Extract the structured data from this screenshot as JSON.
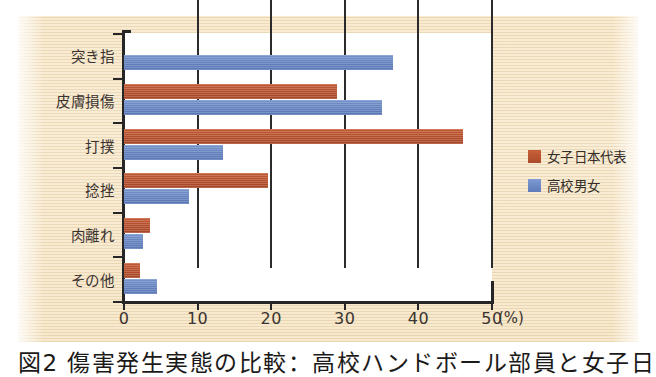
{
  "figure": {
    "caption": "図2 傷害発生実態の比較：高校ハンドボール部員と女子日",
    "background_color": "#f5e5c8",
    "plot_background_color": "#ffffff"
  },
  "chart_data": {
    "type": "bar",
    "orientation": "horizontal",
    "title": "",
    "xlabel": "(%)",
    "ylabel": "",
    "xlim": [
      0,
      50
    ],
    "xticks": [
      0,
      10,
      20,
      30,
      40,
      50
    ],
    "xtick_labels": [
      "0",
      "10",
      "20",
      "30",
      "40",
      "50"
    ],
    "unit": "(%)",
    "grid": true,
    "legend_position": "right",
    "categories": [
      "突き指",
      "皮膚損傷",
      "打撲",
      "捻挫",
      "肉離れ",
      "その他"
    ],
    "series": [
      {
        "name": "女子日本代表",
        "color": "#bb5330",
        "values": [
          0,
          29,
          46,
          19.5,
          3.5,
          2.2
        ]
      },
      {
        "name": "高校男女",
        "color": "#6b89c6",
        "values": [
          36.5,
          35,
          13.5,
          8.8,
          2.6,
          4.5
        ]
      }
    ]
  }
}
